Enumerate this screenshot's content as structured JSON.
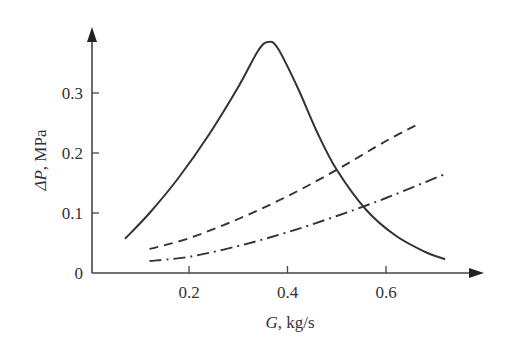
{
  "chart_data": {
    "type": "line",
    "title": "",
    "xlabel": "G, kg/s",
    "ylabel": "ΔP, MPa",
    "xlim": [
      0,
      0.8
    ],
    "ylim": [
      0,
      0.4
    ],
    "x_ticks": [
      0.2,
      0.4,
      0.6
    ],
    "x_tick_labels": [
      "0.2",
      "0.4",
      "0.6"
    ],
    "y_ticks": [
      0,
      0.1,
      0.2,
      0.3
    ],
    "y_tick_labels": [
      "0",
      "0.1",
      "0.2",
      "0.3"
    ],
    "grid": false,
    "legend": null,
    "series": [
      {
        "name": "solid",
        "style": "solid",
        "x": [
          0.07,
          0.12,
          0.18,
          0.24,
          0.3,
          0.34,
          0.36,
          0.38,
          0.42,
          0.46,
          0.5,
          0.56,
          0.62,
          0.68,
          0.72
        ],
        "y": [
          0.057,
          0.1,
          0.16,
          0.23,
          0.31,
          0.37,
          0.385,
          0.375,
          0.31,
          0.235,
          0.172,
          0.105,
          0.062,
          0.035,
          0.023
        ]
      },
      {
        "name": "dashed",
        "style": "dashed",
        "x": [
          0.12,
          0.2,
          0.3,
          0.4,
          0.5,
          0.6,
          0.67
        ],
        "y": [
          0.04,
          0.058,
          0.09,
          0.128,
          0.172,
          0.22,
          0.25
        ]
      },
      {
        "name": "dash-dot",
        "style": "dash-dot",
        "x": [
          0.12,
          0.2,
          0.3,
          0.4,
          0.5,
          0.6,
          0.72
        ],
        "y": [
          0.02,
          0.027,
          0.045,
          0.068,
          0.095,
          0.125,
          0.165
        ]
      }
    ]
  },
  "axes": {
    "x_title_var": "G",
    "x_title_unit": ", kg/s",
    "y_title_var": "ΔP",
    "y_title_unit": ", MPa"
  }
}
